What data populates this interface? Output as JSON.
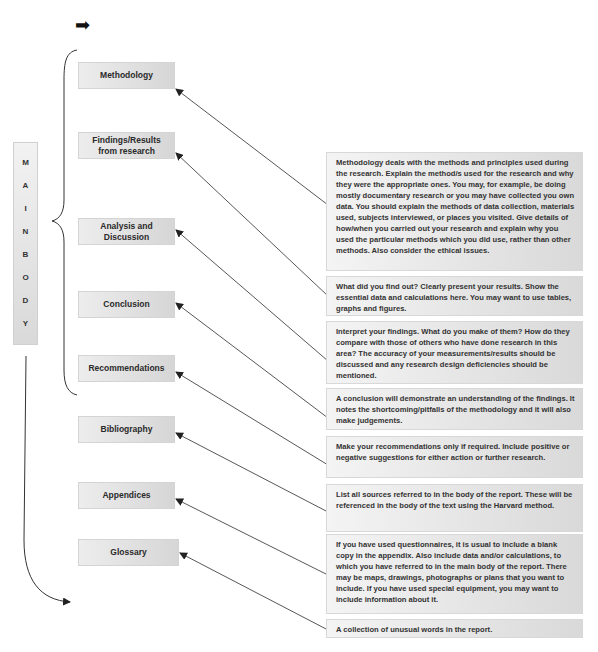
{
  "header": {
    "arrow_icon": "right-arrow-icon",
    "arrow_glyph": "➡"
  },
  "main_body": {
    "letters": [
      "M",
      "A",
      "I",
      "N",
      "B",
      "O",
      "D",
      "Y"
    ]
  },
  "sections": [
    {
      "label": "Methodology"
    },
    {
      "label": "Findings/Results from research"
    },
    {
      "label": "Analysis and Discussion"
    },
    {
      "label": "Conclusion"
    },
    {
      "label": "Recommendations"
    },
    {
      "label": "Bibliography"
    },
    {
      "label": "Appendices"
    },
    {
      "label": "Glossary"
    }
  ],
  "descriptions": [
    {
      "text": "Methodology deals with the methods and principles used during the research. Explain the method/s used for the research and why they were the appropriate ones. You may, for example, be doing mostly documentary research or you may have collected you own data. You should explain the methods of data collection, materials used, subjects interviewed, or places you visited. Give details of how/when you carried out your research and explain why you used the particular methods which you did use, rather than other methods. Also consider the ethical issues."
    },
    {
      "text": "What did you find out? Clearly present your results. Show the essential data and calculations here. You may want to use tables, graphs and figures."
    },
    {
      "text": "Interpret your findings. What do you make of them? How do they compare with those of others who have done research in this area? The accuracy of your measurements/results should be discussed and any research design deficiencies should be mentioned."
    },
    {
      "text": "A conclusion will demonstrate an understanding of the findings. It notes the shortcoming/pitfalls of the methodology and it will also make judgements."
    },
    {
      "text": "Make your recommendations only if required. Include positive or negative suggestions for either action or further research."
    },
    {
      "text": "List all sources referred to in the body of the report. These will be referenced in the body of the text using the Harvard method."
    },
    {
      "text": "If you have used questionnaires, it is usual to include a blank copy in the appendix. Also include data and/or calculations, to which you have referred to in the main body of the report. There may be maps, drawings, photographs or plans that you want to include. If you have used special equipment, you may want to include information about it."
    },
    {
      "text": "A collection of unusual words in the report."
    }
  ]
}
